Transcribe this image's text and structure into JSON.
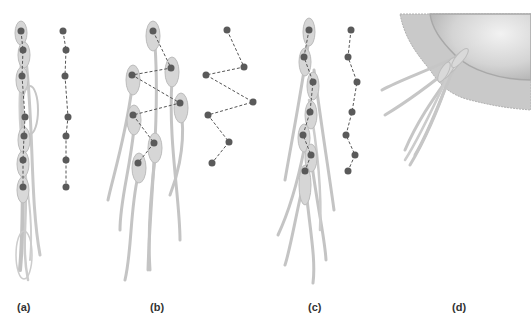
{
  "figure": {
    "colors": {
      "background": "#ffffff",
      "sperm_body": "#d6d6d6",
      "sperm_outline": "#b8b8b8",
      "tail": "#c2c2c2",
      "dot": "#5a5a5a",
      "dot_outline": "#3d3d3d",
      "dash": "#555555",
      "egg_fill": "#d0d0d0",
      "egg_coat": "#c8c8c8",
      "label": "#333333"
    },
    "panels": [
      {
        "id": "a",
        "label": "(a)",
        "label_x": 17,
        "sperm_heads": [
          [
            21,
            31
          ],
          [
            23,
            50
          ],
          [
            22,
            76
          ],
          [
            25,
            117
          ],
          [
            24,
            136
          ],
          [
            23,
            160
          ],
          [
            23,
            187
          ]
        ],
        "schematic_dots": [
          [
            63,
            31
          ],
          [
            66,
            50
          ],
          [
            65,
            76
          ],
          [
            68,
            117
          ],
          [
            66,
            136
          ],
          [
            66,
            160
          ],
          [
            66,
            187
          ]
        ]
      },
      {
        "id": "b",
        "label": "(b)",
        "label_x": 150,
        "sperm_heads": [
          [
            153,
            31
          ],
          [
            171,
            68
          ],
          [
            132,
            75
          ],
          [
            180,
            103
          ],
          [
            133,
            115
          ],
          [
            154,
            143
          ],
          [
            138,
            163
          ]
        ],
        "schematic_dots": [
          [
            227,
            30
          ],
          [
            244,
            67
          ],
          [
            206,
            75
          ],
          [
            253,
            102
          ],
          [
            208,
            115
          ],
          [
            229,
            142
          ],
          [
            212,
            163
          ]
        ]
      },
      {
        "id": "c",
        "label": "(c)",
        "label_x": 308,
        "sperm_heads": [
          [
            309,
            30
          ],
          [
            304,
            57
          ],
          [
            313,
            82
          ],
          [
            310,
            112
          ],
          [
            303,
            135
          ],
          [
            311,
            155
          ],
          [
            305,
            171
          ]
        ],
        "schematic_dots": [
          [
            351,
            30
          ],
          [
            348,
            57
          ],
          [
            357,
            82
          ],
          [
            352,
            112
          ],
          [
            346,
            135
          ],
          [
            355,
            155
          ],
          [
            348,
            171
          ]
        ]
      },
      {
        "id": "d",
        "label": "(d)",
        "label_x": 452,
        "description": "sperm bundle binding to egg coat"
      }
    ]
  }
}
